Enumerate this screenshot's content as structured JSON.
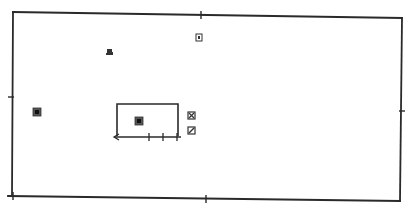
{
  "diagram": {
    "type": "floor-plan-schematic",
    "background": "#ffffff",
    "stroke_color": "#2a2a2a",
    "outer_frame": {
      "corners": {
        "top_left": [
          12,
          12
        ],
        "top_right": [
          402,
          18
        ],
        "bottom_right": [
          400,
          201
        ],
        "bottom_left": [
          12,
          196
        ]
      },
      "midpoint_ticks": [
        "top",
        "bottom",
        "left",
        "right"
      ]
    },
    "inner_room": {
      "x": 117,
      "y": 104,
      "width": 61,
      "height": 32,
      "open_side": "bottom"
    },
    "dimension_line": {
      "y": 137,
      "x_start": 113,
      "x_end": 181,
      "arrow_at": "left",
      "tick_positions": [
        149,
        163,
        177
      ]
    },
    "symbols": [
      {
        "id": "symbol-figure",
        "x": 106,
        "y": 48,
        "glyph": "figure"
      },
      {
        "id": "symbol-top-right",
        "x": 196,
        "y": 34,
        "glyph": "square-outline"
      },
      {
        "id": "symbol-left",
        "x": 34,
        "y": 109,
        "glyph": "square-filled"
      },
      {
        "id": "symbol-center",
        "x": 136,
        "y": 118,
        "glyph": "square-filled"
      },
      {
        "id": "symbol-cross",
        "x": 188,
        "y": 112,
        "glyph": "square-cross"
      },
      {
        "id": "symbol-slash",
        "x": 188,
        "y": 128,
        "glyph": "square-slash"
      }
    ]
  }
}
